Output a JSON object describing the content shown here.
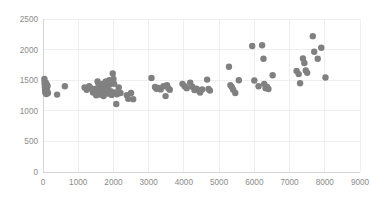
{
  "chart_data": {
    "type": "scatter",
    "title": "",
    "subtitle": "",
    "xlabel": "",
    "ylabel": "",
    "xlim": [
      0,
      9000
    ],
    "ylim": [
      0,
      2500
    ],
    "xticks": [
      0,
      1000,
      2000,
      3000,
      4000,
      5000,
      6000,
      7000,
      8000,
      9000
    ],
    "yticks": [
      0,
      500,
      1000,
      1500,
      2000,
      2500
    ],
    "xtick_labels": [
      "0",
      "1000",
      "2000",
      "3000",
      "4000",
      "5000",
      "6000",
      "7000",
      "8000",
      "9000"
    ],
    "ytick_labels": [
      "0",
      "500",
      "1000",
      "1500",
      "2000",
      "2500"
    ],
    "grid": true,
    "grid_color": "#e8e8e8",
    "legend": false,
    "legend_position": "none",
    "marker": "circle",
    "marker_color": "#808080",
    "marker_size": 3.2,
    "background": "#ffffff",
    "series": [
      {
        "name": "series1",
        "color": "#808080",
        "points": [
          [
            40,
            1520
          ],
          [
            45,
            1470
          ],
          [
            50,
            1430
          ],
          [
            55,
            1385
          ],
          [
            60,
            1350
          ],
          [
            65,
            1300
          ],
          [
            70,
            1420
          ],
          [
            75,
            1375
          ],
          [
            80,
            1460
          ],
          [
            85,
            1330
          ],
          [
            90,
            1390
          ],
          [
            95,
            1275
          ],
          [
            100,
            1440
          ],
          [
            110,
            1355
          ],
          [
            120,
            1310
          ],
          [
            130,
            1405
          ],
          [
            140,
            1290
          ],
          [
            400,
            1265
          ],
          [
            620,
            1400
          ],
          [
            1180,
            1380
          ],
          [
            1240,
            1345
          ],
          [
            1310,
            1400
          ],
          [
            1360,
            1370
          ],
          [
            1420,
            1300
          ],
          [
            1470,
            1355
          ],
          [
            1510,
            1255
          ],
          [
            1550,
            1480
          ],
          [
            1580,
            1420
          ],
          [
            1600,
            1320
          ],
          [
            1620,
            1265
          ],
          [
            1650,
            1390
          ],
          [
            1680,
            1440
          ],
          [
            1700,
            1345
          ],
          [
            1720,
            1240
          ],
          [
            1750,
            1300
          ],
          [
            1780,
            1480
          ],
          [
            1800,
            1420
          ],
          [
            1830,
            1360
          ],
          [
            1850,
            1280
          ],
          [
            1880,
            1500
          ],
          [
            1900,
            1430
          ],
          [
            1920,
            1320
          ],
          [
            1950,
            1260
          ],
          [
            1980,
            1610
          ],
          [
            2000,
            1520
          ],
          [
            2020,
            1440
          ],
          [
            2050,
            1300
          ],
          [
            2080,
            1110
          ],
          [
            2100,
            1270
          ],
          [
            2150,
            1380
          ],
          [
            2200,
            1290
          ],
          [
            2380,
            1255
          ],
          [
            2420,
            1195
          ],
          [
            2500,
            1290
          ],
          [
            2560,
            1190
          ],
          [
            3080,
            1535
          ],
          [
            3180,
            1390
          ],
          [
            3220,
            1360
          ],
          [
            3280,
            1375
          ],
          [
            3340,
            1350
          ],
          [
            3420,
            1400
          ],
          [
            3480,
            1240
          ],
          [
            3520,
            1420
          ],
          [
            3560,
            1370
          ],
          [
            3600,
            1345
          ],
          [
            3960,
            1440
          ],
          [
            4020,
            1400
          ],
          [
            4080,
            1370
          ],
          [
            4180,
            1460
          ],
          [
            4240,
            1395
          ],
          [
            4300,
            1340
          ],
          [
            4360,
            1360
          ],
          [
            4420,
            1330
          ],
          [
            4460,
            1300
          ],
          [
            4520,
            1350
          ],
          [
            4660,
            1510
          ],
          [
            4700,
            1355
          ],
          [
            4740,
            1330
          ],
          [
            5280,
            1720
          ],
          [
            5320,
            1420
          ],
          [
            5360,
            1390
          ],
          [
            5400,
            1345
          ],
          [
            5460,
            1290
          ],
          [
            5560,
            1500
          ],
          [
            5940,
            2060
          ],
          [
            6000,
            1495
          ],
          [
            6120,
            1400
          ],
          [
            6220,
            2070
          ],
          [
            6260,
            1850
          ],
          [
            6280,
            1440
          ],
          [
            6320,
            1370
          ],
          [
            6360,
            1390
          ],
          [
            6400,
            1355
          ],
          [
            6520,
            1580
          ],
          [
            7200,
            1650
          ],
          [
            7260,
            1600
          ],
          [
            7300,
            1450
          ],
          [
            7380,
            1855
          ],
          [
            7420,
            1780
          ],
          [
            7460,
            1660
          ],
          [
            7500,
            1620
          ],
          [
            7660,
            2220
          ],
          [
            7700,
            1965
          ],
          [
            7800,
            1850
          ],
          [
            7900,
            2030
          ],
          [
            8020,
            1545
          ]
        ]
      }
    ]
  },
  "axes": {
    "plot_left": 43,
    "plot_right": 360,
    "plot_top": 19,
    "plot_bottom": 172
  }
}
